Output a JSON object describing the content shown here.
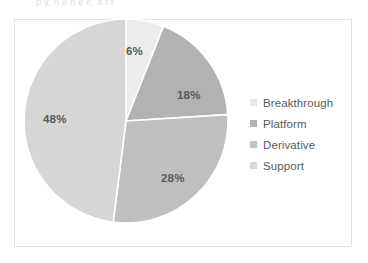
{
  "top_text_fragment": "p   y, n  e  n   e e, a  t  t  ",
  "frame": {
    "border_color": "#e3e3e3",
    "background": "#ffffff"
  },
  "chart_data": {
    "type": "pie",
    "title": "",
    "subtitle": "",
    "xlabel": "",
    "ylabel": "",
    "grid": false,
    "legend_position": "right",
    "start_angle_deg": 0,
    "direction": "clockwise",
    "separator_color": "#ffffff",
    "categories": [
      "Breakthrough",
      "Platform",
      "Derivative",
      "Support"
    ],
    "values": [
      6,
      18,
      28,
      48
    ],
    "value_unit": "%",
    "data_labels": [
      "6%",
      "18%",
      "28%",
      "48%"
    ],
    "colors": [
      "#ececec",
      "#b2b2b2",
      "#bfbfbf",
      "#d6d6d6"
    ],
    "slices": [
      {
        "label": "Breakthrough",
        "value": 6,
        "data_label": "6%",
        "color": "#ececec"
      },
      {
        "label": "Platform",
        "value": 18,
        "data_label": "18%",
        "color": "#b2b2b2"
      },
      {
        "label": "Derivative",
        "value": 28,
        "data_label": "28%",
        "color": "#bfbfbf"
      },
      {
        "label": "Support",
        "value": 48,
        "data_label": "48%",
        "color": "#d6d6d6"
      }
    ]
  },
  "legend": {
    "items": [
      {
        "label": "Breakthrough",
        "color": "#e8e8e8"
      },
      {
        "label": "Platform",
        "color": "#b5b5b5"
      },
      {
        "label": "Derivative",
        "color": "#c2c2c2"
      },
      {
        "label": "Support",
        "color": "#d8d8d8"
      }
    ]
  }
}
